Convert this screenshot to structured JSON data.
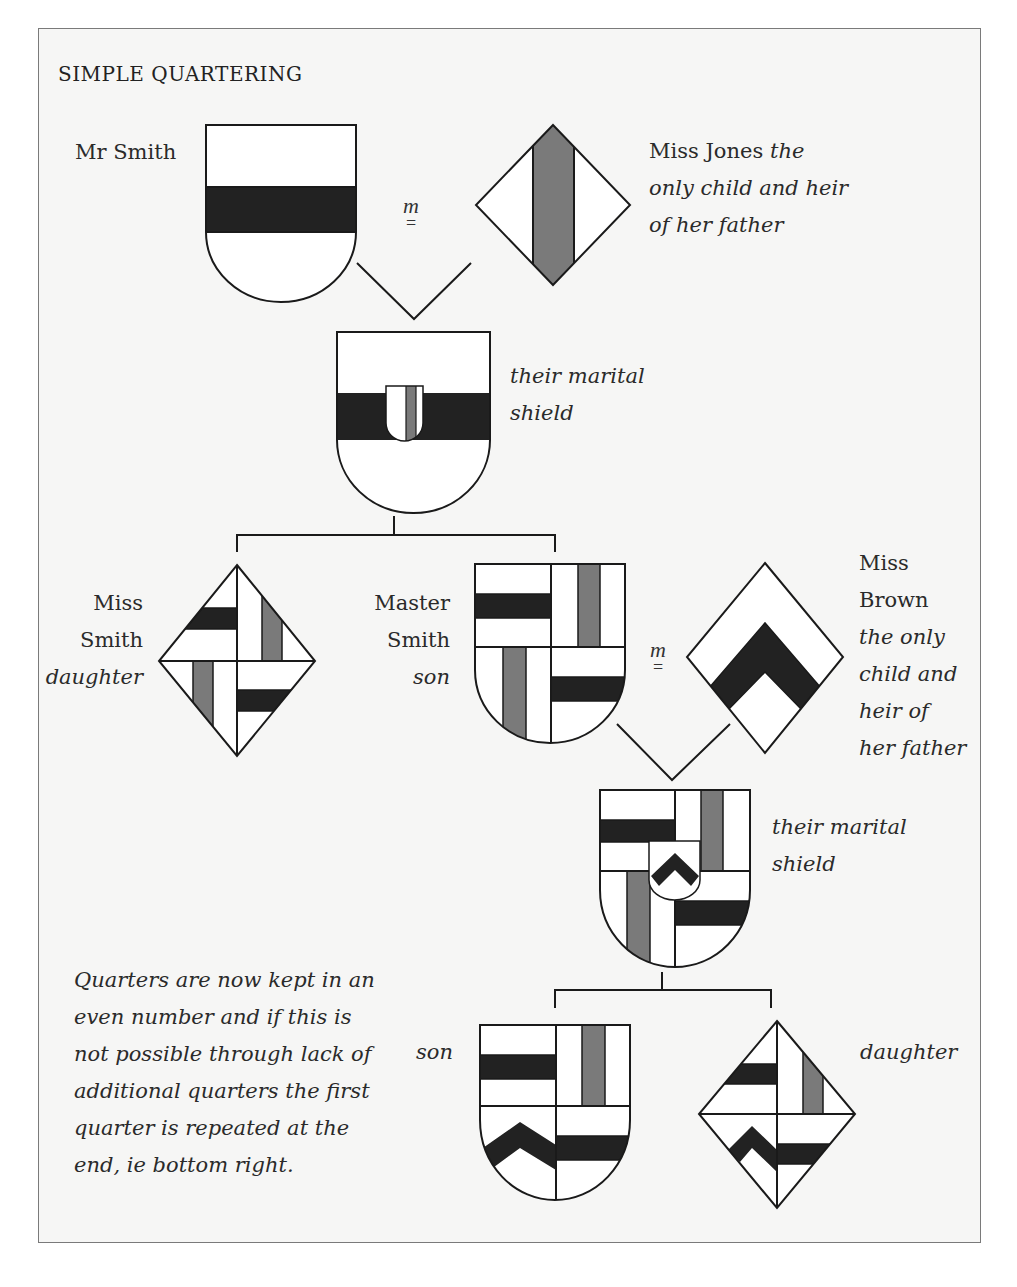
{
  "title": "SIMPLE QUARTERING",
  "marriage_symbol": {
    "m": "m",
    "eq": "="
  },
  "people": {
    "mr_smith": {
      "name": "Mr Smith"
    },
    "miss_jones": {
      "name": "Miss Jones",
      "desc_1": "the",
      "desc_2": "only child and heir",
      "desc_3": "of her father"
    },
    "marital_1": {
      "line_1": "their marital",
      "line_2": "shield"
    },
    "miss_smith": {
      "line_1": "Miss",
      "line_2": "Smith",
      "role": "daughter"
    },
    "master_smith": {
      "line_1": "Master",
      "line_2": "Smith",
      "role": "son"
    },
    "miss_brown": {
      "line_1": "Miss",
      "line_2": "Brown",
      "desc_1": "the only",
      "desc_2": "child and",
      "desc_3": "heir of",
      "desc_4": "her father"
    },
    "marital_2": {
      "line_1": "their marital",
      "line_2": "shield"
    },
    "grandson": {
      "role": "son"
    },
    "granddaughter": {
      "role": "daughter"
    }
  },
  "note": {
    "lines": [
      "Quarters are now kept in an",
      "even number and if this is",
      "not possible through lack of",
      "additional quarters the first",
      "quarter is repeated at the",
      "end, ie bottom right."
    ]
  },
  "colors": {
    "fess_black": "#222222",
    "pale_grey": "#7a7a7a",
    "field_white": "#ffffff",
    "outline": "#1a1a1a",
    "frame": "#7a7a7a"
  }
}
